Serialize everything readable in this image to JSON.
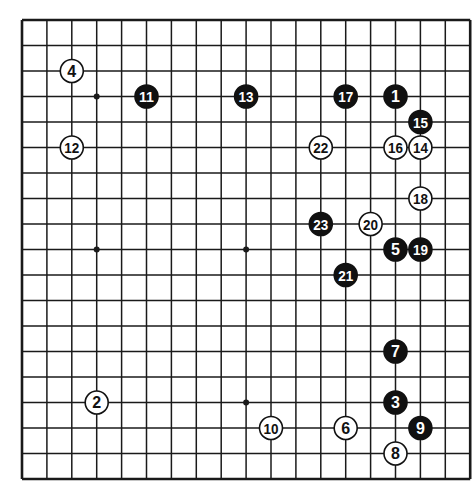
{
  "board": {
    "size": 19,
    "origin_x": 22,
    "origin_y": 20,
    "spacing_x": 24.9,
    "spacing_y": 25.5,
    "line_color": "#1a1a1a",
    "background": "#ffffff",
    "star_points": [
      [
        3,
        3
      ],
      [
        9,
        3
      ],
      [
        15,
        3
      ],
      [
        3,
        9
      ],
      [
        9,
        9
      ],
      [
        15,
        9
      ],
      [
        3,
        15
      ],
      [
        9,
        15
      ],
      [
        15,
        15
      ]
    ]
  },
  "stones": [
    {
      "n": "1",
      "color": "black",
      "col": 15,
      "row": 3
    },
    {
      "n": "2",
      "color": "white",
      "col": 3,
      "row": 15
    },
    {
      "n": "3",
      "color": "black",
      "col": 15,
      "row": 15
    },
    {
      "n": "4",
      "color": "white",
      "col": 2,
      "row": 2
    },
    {
      "n": "5",
      "color": "black",
      "col": 15,
      "row": 9
    },
    {
      "n": "6",
      "color": "white",
      "col": 13,
      "row": 16
    },
    {
      "n": "7",
      "color": "black",
      "col": 15,
      "row": 13
    },
    {
      "n": "8",
      "color": "white",
      "col": 15,
      "row": 17
    },
    {
      "n": "9",
      "color": "black",
      "col": 16,
      "row": 16
    },
    {
      "n": "10",
      "color": "white",
      "col": 10,
      "row": 16
    },
    {
      "n": "11",
      "color": "black",
      "col": 5,
      "row": 3
    },
    {
      "n": "12",
      "color": "white",
      "col": 2,
      "row": 5
    },
    {
      "n": "13",
      "color": "black",
      "col": 9,
      "row": 3
    },
    {
      "n": "14",
      "color": "white",
      "col": 16,
      "row": 5
    },
    {
      "n": "15",
      "color": "black",
      "col": 16,
      "row": 4
    },
    {
      "n": "16",
      "color": "white",
      "col": 15,
      "row": 5
    },
    {
      "n": "17",
      "color": "black",
      "col": 13,
      "row": 3
    },
    {
      "n": "18",
      "color": "white",
      "col": 16,
      "row": 7
    },
    {
      "n": "19",
      "color": "black",
      "col": 16,
      "row": 9
    },
    {
      "n": "20",
      "color": "white",
      "col": 14,
      "row": 8
    },
    {
      "n": "21",
      "color": "black",
      "col": 13,
      "row": 10
    },
    {
      "n": "22",
      "color": "white",
      "col": 12,
      "row": 5
    },
    {
      "n": "23",
      "color": "black",
      "col": 12,
      "row": 8
    }
  ]
}
